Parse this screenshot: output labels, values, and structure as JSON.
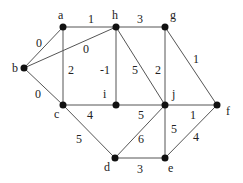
{
  "diagram": {
    "type": "weighted-undirected-graph",
    "nodes": [
      {
        "id": "a",
        "label": "a",
        "x": 63,
        "y": 27,
        "lx": 58,
        "ly": 19
      },
      {
        "id": "b",
        "label": "b",
        "x": 24,
        "y": 68,
        "lx": 12,
        "ly": 72
      },
      {
        "id": "c",
        "label": "c",
        "x": 63,
        "y": 105,
        "lx": 54,
        "ly": 118
      },
      {
        "id": "d",
        "label": "d",
        "x": 115,
        "y": 158,
        "lx": 104,
        "ly": 171
      },
      {
        "id": "e",
        "label": "e",
        "x": 165,
        "y": 158,
        "lx": 168,
        "ly": 172
      },
      {
        "id": "f",
        "label": "f",
        "x": 217,
        "y": 105,
        "lx": 226,
        "ly": 115
      },
      {
        "id": "g",
        "label": "g",
        "x": 165,
        "y": 27,
        "lx": 170,
        "ly": 19
      },
      {
        "id": "h",
        "label": "h",
        "x": 116,
        "y": 27,
        "lx": 112,
        "ly": 19
      },
      {
        "id": "i",
        "label": "i",
        "x": 116,
        "y": 105,
        "lx": 103,
        "ly": 98
      },
      {
        "id": "j",
        "label": "j",
        "x": 165,
        "y": 105,
        "lx": 172,
        "ly": 98
      }
    ],
    "edges": [
      {
        "from": "a",
        "to": "b",
        "weight": "0",
        "lx": 36,
        "ly": 47
      },
      {
        "from": "a",
        "to": "h",
        "weight": "1",
        "lx": 88,
        "ly": 23
      },
      {
        "from": "a",
        "to": "c",
        "weight": "2",
        "lx": 68,
        "ly": 74
      },
      {
        "from": "b",
        "to": "h",
        "weight": "0",
        "lx": 83,
        "ly": 53
      },
      {
        "from": "b",
        "to": "c",
        "weight": "0",
        "lx": 35,
        "ly": 98
      },
      {
        "from": "h",
        "to": "g",
        "weight": "3",
        "lx": 137,
        "ly": 23
      },
      {
        "from": "h",
        "to": "i",
        "weight": "-1",
        "lx": 100,
        "ly": 74
      },
      {
        "from": "h",
        "to": "j",
        "weight": "5",
        "lx": 132,
        "ly": 74
      },
      {
        "from": "g",
        "to": "j",
        "weight": "2",
        "lx": 155,
        "ly": 74
      },
      {
        "from": "g",
        "to": "f",
        "weight": "1",
        "lx": 193,
        "ly": 63
      },
      {
        "from": "c",
        "to": "i",
        "weight": "4",
        "lx": 87,
        "ly": 119
      },
      {
        "from": "i",
        "to": "j",
        "weight": "5",
        "lx": 138,
        "ly": 119
      },
      {
        "from": "j",
        "to": "f",
        "weight": "1",
        "lx": 190,
        "ly": 119
      },
      {
        "from": "c",
        "to": "d",
        "weight": "5",
        "lx": 76,
        "ly": 143
      },
      {
        "from": "d",
        "to": "j",
        "weight": "6",
        "lx": 138,
        "ly": 143
      },
      {
        "from": "j",
        "to": "e",
        "weight": "5",
        "lx": 171,
        "ly": 133
      },
      {
        "from": "d",
        "to": "e",
        "weight": "3",
        "lx": 137,
        "ly": 173
      },
      {
        "from": "e",
        "to": "f",
        "weight": "4",
        "lx": 193,
        "ly": 141
      }
    ],
    "colors": {
      "node": "#111111",
      "edge": "#555555",
      "text": "#222222",
      "background": "#ffffff"
    }
  }
}
